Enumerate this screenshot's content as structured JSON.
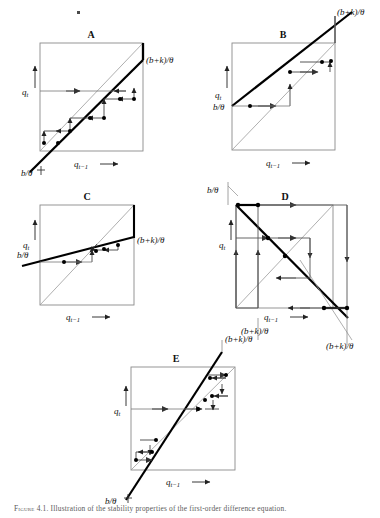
{
  "figure": {
    "title": "Illustration of the stability properties of the first-order difference equation",
    "caption_prefix": "Figure 4.1.",
    "caption_text": "Illustration of the stability properties of the first-order difference equation.",
    "speck_artifact": true,
    "axis_x_label": "q",
    "axis_x_sub": "t−1",
    "axis_y_label": "q",
    "axis_y_sub": "t",
    "label_b_theta": "b/θ",
    "label_bk_theta": "(b+k)/θ",
    "line_color_thick": "#000000",
    "line_color_thin": "#8a8a8a",
    "box_color": "#8a8a8a",
    "cobweb_color": "#555555",
    "dot_color": "#000000"
  },
  "panels": [
    {
      "id": "A",
      "letter": "A",
      "box": {
        "x": 40,
        "y": 43,
        "w": 103,
        "h": 108
      },
      "map": {
        "slope": 1.32,
        "intercept": -34,
        "kind": "positive-steep",
        "note": "slope > 1, divergent monotone"
      },
      "corner_labels": [
        {
          "name": "bk-theta-label",
          "text": "(b+k)/θ",
          "x": 146,
          "y": 62,
          "anchor": "start"
        },
        {
          "name": "b-theta-label",
          "text": "b/θ",
          "x": 22,
          "y": 174,
          "anchor": "start"
        }
      ],
      "axis_labels": {
        "y": {
          "x": 24,
          "y": 94,
          "arrow_x": 36,
          "arrow_y1": 88,
          "arrow_y2": 68
        },
        "x": {
          "x": 78,
          "y": 166,
          "arrow_x1": 98,
          "arrow_x2": 118,
          "arrow_y": 163
        }
      },
      "qt_line": {
        "y": 91,
        "x1": 40,
        "x2": 128
      },
      "cobweb": {
        "start": 47,
        "steps": 5,
        "direction": "outward",
        "note": "staircase moving up-right away from fixed point"
      }
    },
    {
      "id": "B",
      "letter": "B",
      "box": {
        "x": 232,
        "y": 43,
        "w": 103,
        "h": 107
      },
      "map": {
        "slope": 0.62,
        "intercept": 38,
        "kind": "positive-shallow-high",
        "note": "0 < slope < 1, convergent monotone"
      },
      "corner_labels": [
        {
          "name": "bk-theta-label",
          "text": "(b+k)/θ",
          "x": 337,
          "y": 14,
          "anchor": "start"
        },
        {
          "name": "b-theta-label",
          "text": "b/θ",
          "x": 214,
          "y": 94,
          "anchor": "start"
        }
      ],
      "axis_labels": {
        "y": {
          "x": 216,
          "y": 84,
          "arrow_x": 228,
          "arrow_y1": 78,
          "arrow_y2": 60
        },
        "x": {
          "x": 270,
          "y": 164,
          "arrow_x1": 290,
          "arrow_x2": 310,
          "arrow_y": 161
        }
      },
      "qt_line": {
        "y": 123,
        "x1": 232,
        "x2": 296
      },
      "cobweb": {
        "start": 240,
        "steps": 4,
        "direction": "inward",
        "note": "staircase converging to fixed point at upper right"
      }
    },
    {
      "id": "C",
      "letter": "C",
      "box": {
        "x": 40,
        "y": 205,
        "w": 94,
        "h": 100
      },
      "map": {
        "slope": 0.38,
        "intercept": 160,
        "kind": "positive-shallow",
        "note": "0 < slope < 1, convergent monotone to interior fixed point"
      },
      "corner_labels": [
        {
          "name": "bk-theta-label",
          "text": "(b+k)/θ",
          "x": 137,
          "y": 242,
          "anchor": "start"
        },
        {
          "name": "b-theta-label",
          "text": "b/θ",
          "x": 18,
          "y": 253,
          "anchor": "start"
        }
      ],
      "axis_labels": {
        "y": {
          "x": 24,
          "y": 240,
          "arrow_x": 36,
          "arrow_y1": 234,
          "arrow_y2": 218
        },
        "x": {
          "x": 70,
          "y": 318,
          "arrow_x1": 90,
          "arrow_x2": 108,
          "arrow_y": 315
        }
      },
      "qt_line": {
        "y": 250,
        "x1": 40,
        "x2": 88
      },
      "cobweb": {
        "start": 46,
        "steps": 4,
        "direction": "inward",
        "note": "converges quickly to intersection with 45 degree line"
      }
    },
    {
      "id": "D",
      "letter": "D",
      "box": {
        "x": 236,
        "y": 205,
        "w": 97,
        "h": 103
      },
      "map": {
        "slope": -1.35,
        "intercept": 530,
        "kind": "negative-steep",
        "note": "slope < -1, divergent oscillatory"
      },
      "corner_labels": [
        {
          "name": "b-theta-label",
          "text": "b/θ",
          "x": 208,
          "y": 192,
          "anchor": "start"
        },
        {
          "name": "bk-theta-label-left",
          "text": "(b+k)/θ",
          "x": 243,
          "y": 330,
          "anchor": "start"
        },
        {
          "name": "bk-theta-label-right",
          "text": "(b+k)/θ",
          "x": 330,
          "y": 345,
          "anchor": "start"
        }
      ],
      "axis_labels": {
        "y": {
          "x": 220,
          "y": 240,
          "arrow_x": 232,
          "arrow_y1": 234,
          "arrow_y2": 218
        },
        "x": {
          "x": 268,
          "y": 318,
          "arrow_x1": 288,
          "arrow_x2": 306,
          "arrow_y": 315
        }
      },
      "qt_line": {
        "y": 238,
        "x1": 236,
        "x2": 286
      },
      "cobweb": {
        "start": 268,
        "steps": 5,
        "direction": "outward",
        "note": "rectangular spiral expanding outward"
      }
    },
    {
      "id": "E",
      "letter": "E",
      "box": {
        "x": 131,
        "y": 367,
        "w": 104,
        "h": 103
      },
      "map": {
        "slope": 1.55,
        "intercept": -200,
        "kind": "positive-steep",
        "note": "slope > 1, divergent monotone staircase"
      },
      "corner_labels": [
        {
          "name": "bk-theta-label",
          "text": "(b+k)/θ",
          "x": 218,
          "y": 337,
          "anchor": "start"
        },
        {
          "name": "b-theta-label",
          "text": "b/θ",
          "x": 108,
          "y": 497,
          "anchor": "start"
        }
      ],
      "axis_labels": {
        "y": {
          "x": 117,
          "y": 412,
          "arrow_x": 129,
          "arrow_y1": 406,
          "arrow_y2": 388
        },
        "x": {
          "x": 170,
          "y": 483,
          "arrow_x1": 190,
          "arrow_x2": 210,
          "arrow_y": 480
        }
      },
      "qt_line": {
        "y": 409,
        "x1": 131,
        "x2": 198
      },
      "cobweb": {
        "start": 138,
        "steps": 5,
        "direction": "outward",
        "note": "staircase diverging upward to the right"
      }
    }
  ]
}
